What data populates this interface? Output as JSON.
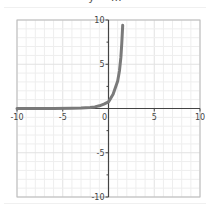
{
  "chart_data": {
    "type": "line",
    "title": "y = …",
    "xlabel": "",
    "ylabel": "",
    "xlim": [
      -10,
      10
    ],
    "ylim": [
      -10,
      10
    ],
    "grid": true,
    "x_ticks": [
      -10,
      -5,
      0,
      5,
      10
    ],
    "y_ticks": [
      -10,
      -5,
      5,
      10
    ],
    "x_tick_labels": [
      "-10",
      "-5",
      "0",
      "5",
      "10"
    ],
    "y_tick_labels": [
      "-10",
      "-5",
      "5",
      "10"
    ],
    "series": [
      {
        "name": "curve",
        "color": "#7a7a7a",
        "x": [
          -10,
          -6,
          -4,
          -3,
          -2,
          -1.5,
          -1,
          -0.5,
          0,
          0.5,
          1,
          1.2,
          1.35,
          1.45,
          1.55
        ],
        "y": [
          0,
          0,
          0.02,
          0.05,
          0.1,
          0.18,
          0.3,
          0.5,
          0.75,
          1.6,
          3.1,
          4.3,
          5.8,
          7.4,
          9.4
        ]
      }
    ]
  },
  "colors": {
    "axis": "#444444",
    "frame": "#bbbbbb",
    "grid_minor": "#eeeeee",
    "grid_major": "#e2e2e2",
    "curve": "#7a7a7a"
  }
}
